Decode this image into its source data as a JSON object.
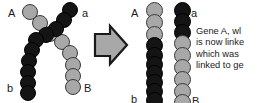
{
  "figure": {
    "name": "chromosomal-crossover-diagram",
    "background_color": "#ffffff",
    "colors": {
      "dark_chromatid": "#141414",
      "light_chromatid": "#a8a8a8",
      "bead_outline": "#000000",
      "arrow_fill": "#a8a8a8",
      "arrow_outline": "#1a1a1a",
      "text": "#1a1a1a"
    }
  },
  "left_panel": {
    "name": "before-crossover",
    "description": "Two homologous chromosomes crossing over at a chiasma",
    "labels": {
      "top_left": "A",
      "top_right": "a",
      "bottom_left": "b",
      "bottom_right": "B"
    },
    "strands": [
      {
        "name": "strand-A-to-B",
        "start_label": "A",
        "end_label": "B",
        "color": "light"
      },
      {
        "name": "strand-a-to-b",
        "start_label": "a",
        "end_label": "b",
        "color": "dark"
      }
    ]
  },
  "arrow": {
    "name": "transformation-arrow",
    "direction": "right",
    "icon": "block-arrow-right-icon"
  },
  "right_panel": {
    "name": "after-crossover",
    "description": "Two recombinant chromosomes after exchange of segments",
    "strands": [
      {
        "name": "recombinant-strand-A-b",
        "top_label": "A",
        "bottom_label": "b",
        "top_segment_color": "light",
        "bottom_segment_color": "dark",
        "light_bead_count": 3,
        "dark_bead_count": 7
      },
      {
        "name": "recombinant-strand-a-B",
        "top_label": "a",
        "bottom_label": "B",
        "top_segment_color": "dark",
        "bottom_segment_color": "light",
        "dark_bead_count": 3,
        "light_bead_count": 7
      }
    ]
  },
  "caption": {
    "name": "explanation-text",
    "truncated": true,
    "lines": [
      "Gene A, wl",
      "is now linke",
      "which was",
      "linked to ge"
    ]
  }
}
